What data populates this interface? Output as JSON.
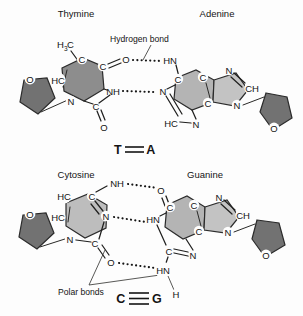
{
  "figure": {
    "background_color": "#fdfdfd",
    "width": 303,
    "height": 316
  },
  "colors": {
    "thymine_ring": "#8d8d8d",
    "adenine_ring_six": "#b4b4b4",
    "adenine_ring_five": "#c3c3c3",
    "cytosine_ring": "#bdbdbd",
    "guanine_ring_six": "#b4b4b4",
    "guanine_ring_five": "#c3c3c3",
    "sugar": "#727272",
    "bond_stroke": "#20201f",
    "text": "#141414"
  },
  "pairs": [
    {
      "id": "thymine-adenine",
      "left_title": "Thymine",
      "right_title": "Adenine",
      "callout": "Hydrogen bond",
      "code_left": "T",
      "code_right": "A",
      "bond_count": 2,
      "bond_symbol": "=",
      "left_atoms": [
        "H",
        "3",
        "C",
        "C",
        "C",
        "O",
        "HC",
        "N",
        "C",
        "O",
        "NH"
      ],
      "right_atoms": [
        "HN",
        "C",
        "C",
        "N",
        "CH",
        "N",
        "C",
        "N",
        "HC",
        "N",
        "O"
      ]
    },
    {
      "id": "cytosine-guanine",
      "left_title": "Cytosine",
      "right_title": "Guanine",
      "callout": "Polar bonds",
      "code_left": "C",
      "code_right": "G",
      "bond_count": 3,
      "bond_symbol": "≡",
      "left_atoms": [
        "HC",
        "HC",
        "C",
        "NH",
        "N",
        "N",
        "C",
        "O",
        "O"
      ],
      "right_atoms": [
        "O",
        "C",
        "C",
        "N",
        "CH",
        "N",
        "C",
        "N",
        "HN",
        "C",
        "HN",
        "H",
        "O"
      ]
    }
  ],
  "atoms": {
    "t_h": "H",
    "t_h_sub": "3",
    "t_c_methyl": "C",
    "t_c5": "C",
    "t_c4": "C",
    "t_o4": "O",
    "t_hc6": "HC",
    "t_n1": "N",
    "t_c2": "C",
    "t_o2": "O",
    "t_n3h": "NH",
    "t_sugar_o": "O",
    "a_n6h": "HN",
    "a_c6": "C",
    "a_c5": "C",
    "a_n7": "N",
    "a_c8h": "CH",
    "a_n9": "N",
    "a_c4": "C",
    "a_n1": "N",
    "a_c2h": "HC",
    "a_n3": "N",
    "a_sugar_o": "O",
    "c_hc5": "HC",
    "c_hc6": "HC",
    "c_c4": "C",
    "c_n4h": "NH",
    "c_n3": "N",
    "c_n1": "N",
    "c_c2": "C",
    "c_o2": "O",
    "c_sugar_o": "O",
    "g_o6": "O",
    "g_c6": "C",
    "g_c5": "C",
    "g_n7": "N",
    "g_c8h": "CH",
    "g_n9": "N",
    "g_c4": "C",
    "g_n1h": "HN",
    "g_c2": "C",
    "g_n3": "N",
    "g_n2h": "HN",
    "g_h": "H",
    "g_sugar_o": "O"
  }
}
